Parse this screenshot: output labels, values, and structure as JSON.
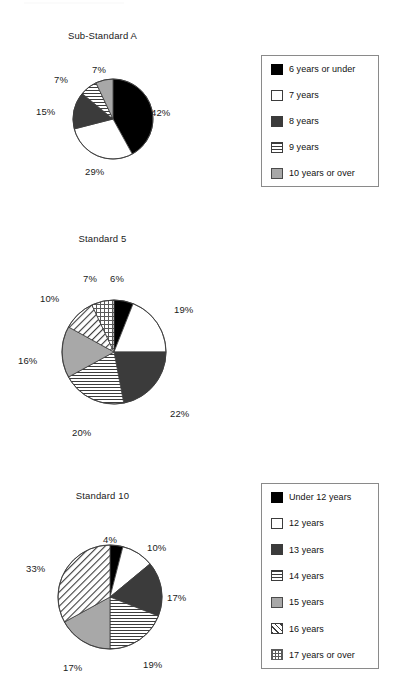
{
  "chart_data": [
    {
      "type": "pie",
      "title": "Sub-Standard A",
      "categories": [
        "6 years or under",
        "7 years",
        "8 years",
        "9 years",
        "10 years or over"
      ],
      "values": [
        42,
        29,
        15,
        7,
        7
      ],
      "value_labels": [
        "42%",
        "29%",
        "15%",
        "7%",
        "7%"
      ],
      "patterns": [
        "solid-black",
        "solid-white",
        "solid-darkgray",
        "horizontal-lines",
        "solid-gray"
      ],
      "legend_position": "right",
      "start_angle_deg": 0,
      "direction": "clockwise"
    },
    {
      "type": "pie",
      "title": "Standard 5",
      "categories": [
        "Under 12 years",
        "12 years",
        "13 years",
        "14 years",
        "15 years",
        "16 years",
        "17 years or over"
      ],
      "values": [
        6,
        19,
        22,
        20,
        16,
        10,
        7
      ],
      "value_labels": [
        "6%",
        "19%",
        "22%",
        "20%",
        "16%",
        "10%",
        "7%"
      ],
      "patterns": [
        "solid-black",
        "solid-white",
        "solid-darkgray",
        "horizontal-lines",
        "solid-gray",
        "diagonal-hatch",
        "crosshatch-grid"
      ],
      "legend_position": "right",
      "start_angle_deg": 0,
      "direction": "clockwise"
    },
    {
      "type": "pie",
      "title": "Standard 10",
      "categories": [
        "Under 17 years",
        "17 years",
        "18 years",
        "19 years",
        "20 years",
        "21 years or above"
      ],
      "values": [
        4,
        10,
        17,
        19,
        17,
        33
      ],
      "value_labels": [
        "4%",
        "10%",
        "17%",
        "19%",
        "17%",
        "33%"
      ],
      "patterns": [
        "solid-black",
        "solid-white",
        "solid-darkgray",
        "horizontal-lines",
        "solid-gray",
        "diagonal-hatch"
      ],
      "legend_position": "right",
      "start_angle_deg": 0,
      "direction": "clockwise"
    }
  ],
  "colors": {
    "black": "#000000",
    "white": "#ffffff",
    "dark_gray": "#3b3b3b",
    "gray": "#a8a8a8",
    "outline": "#3c3c3c",
    "legend_border": "#8a8a8a",
    "text": "#111111",
    "background": "#ffffff"
  },
  "charts": [
    {
      "title": "Sub-Standard A",
      "geometry": {
        "cx": 113,
        "cy": 119,
        "r": 40
      },
      "slices": [
        {
          "label": "6 years or under",
          "pct": 42,
          "pct_text": "42%",
          "pattern": "solid-black",
          "label_x": 151,
          "label_y": 107
        },
        {
          "label": "7 years",
          "pct": 29,
          "pct_text": "29%",
          "pattern": "solid-white",
          "label_x": 85,
          "label_y": 166
        },
        {
          "label": "8 years",
          "pct": 15,
          "pct_text": "15%",
          "pattern": "solid-darkgray",
          "label_x": 36,
          "label_y": 106
        },
        {
          "label": "9 years",
          "pct": 7,
          "pct_text": "7%",
          "pattern": "horizontal-lines",
          "label_x": 54,
          "label_y": 74
        },
        {
          "label": "10 years or over",
          "pct": 7,
          "pct_text": "7%",
          "pattern": "solid-gray",
          "label_x": 92,
          "label_y": 64
        }
      ],
      "legend": [
        {
          "label": "6 years or under",
          "pattern": "solid-black"
        },
        {
          "label": "7 years",
          "pattern": "solid-white"
        },
        {
          "label": "8 years",
          "pattern": "solid-darkgray"
        },
        {
          "label": "9 years",
          "pattern": "horizontal-lines"
        },
        {
          "label": "10 years or over",
          "pattern": "solid-gray"
        }
      ]
    },
    {
      "title": "Standard 5",
      "geometry": {
        "cx": 114,
        "cy": 352,
        "r": 52
      },
      "slices": [
        {
          "label": "Under 12 years",
          "pct": 6,
          "pct_text": "6%",
          "pattern": "solid-black",
          "label_x": 110,
          "label_y": 273
        },
        {
          "label": "12 years",
          "pct": 19,
          "pct_text": "19%",
          "pattern": "solid-white",
          "label_x": 174,
          "label_y": 304
        },
        {
          "label": "13 years",
          "pct": 22,
          "pct_text": "22%",
          "pattern": "solid-darkgray",
          "label_x": 170,
          "label_y": 408
        },
        {
          "label": "14 years",
          "pct": 20,
          "pct_text": "20%",
          "pattern": "horizontal-lines",
          "label_x": 72,
          "label_y": 427
        },
        {
          "label": "15 years",
          "pct": 16,
          "pct_text": "16%",
          "pattern": "solid-gray",
          "label_x": 18,
          "label_y": 355
        },
        {
          "label": "16 years",
          "pct": 10,
          "pct_text": "10%",
          "pattern": "diagonal-hatch",
          "label_x": 40,
          "label_y": 293
        },
        {
          "label": "17 years or over",
          "pct": 7,
          "pct_text": "7%",
          "pattern": "crosshatch-grid",
          "label_x": 83,
          "label_y": 273
        }
      ],
      "legend": [
        {
          "label": "Under 12 years",
          "pattern": "solid-black"
        },
        {
          "label": "12 years",
          "pattern": "solid-white"
        },
        {
          "label": "13 years",
          "pattern": "solid-darkgray"
        },
        {
          "label": "14 years",
          "pattern": "horizontal-lines"
        },
        {
          "label": "15 years",
          "pattern": "solid-gray"
        },
        {
          "label": "16 years",
          "pattern": "diagonal-hatch"
        },
        {
          "label": "17 years or over",
          "pattern": "crosshatch-grid"
        }
      ]
    },
    {
      "title": "Standard 10",
      "geometry": {
        "cx": 110,
        "cy": 597,
        "r": 52
      },
      "slices": [
        {
          "label": "Under 17 years",
          "pct": 4,
          "pct_text": "4%",
          "pattern": "solid-black",
          "label_x": 103,
          "label_y": 534
        },
        {
          "label": "17 years",
          "pct": 10,
          "pct_text": "10%",
          "pattern": "solid-white",
          "label_x": 147,
          "label_y": 542
        },
        {
          "label": "18 years",
          "pct": 17,
          "pct_text": "17%",
          "pattern": "solid-darkgray",
          "label_x": 167,
          "label_y": 592
        },
        {
          "label": "19 years",
          "pct": 19,
          "pct_text": "19%",
          "pattern": "horizontal-lines",
          "label_x": 143,
          "label_y": 659
        },
        {
          "label": "20 years",
          "pct": 17,
          "pct_text": "17%",
          "pattern": "solid-gray",
          "label_x": 63,
          "label_y": 662
        },
        {
          "label": "21 years or above",
          "pct": 33,
          "pct_text": "33%",
          "pattern": "diagonal-hatch",
          "label_x": 26,
          "label_y": 563
        }
      ],
      "legend": [
        {
          "label": "Under 17 years",
          "pattern": "solid-black"
        },
        {
          "label": "17 years",
          "pattern": "solid-white"
        },
        {
          "label": "18 years",
          "pattern": "solid-darkgray"
        },
        {
          "label": "19 years",
          "pattern": "horizontal-lines"
        },
        {
          "label": "20 years",
          "pattern": "solid-gray"
        },
        {
          "label": "21 years or above",
          "pattern": "diagonal-hatch"
        }
      ]
    }
  ]
}
